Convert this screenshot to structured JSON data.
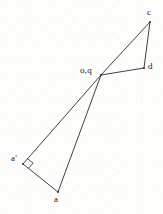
{
  "figure": {
    "kind": "line-diagram",
    "width": 163,
    "height": 214,
    "background_color": "#fdfdfc",
    "stroke_color": "#2b2b2b",
    "stroke_width": 0.9,
    "label_color": "#1a1a1a"
  },
  "points": {
    "o_q": {
      "name": "o,q",
      "x": 101,
      "y": 75
    },
    "c": {
      "name": "c",
      "x": 150,
      "y": 22
    },
    "d": {
      "name": "d",
      "x": 144,
      "y": 68
    },
    "a_prime": {
      "name": "a'",
      "x": 23,
      "y": 164
    },
    "a": {
      "name": "a",
      "x": 58,
      "y": 192
    }
  },
  "edges": [
    {
      "name": "oq-to-c",
      "from": "o_q",
      "to": "c"
    },
    {
      "name": "c-to-d",
      "from": "c",
      "to": "d"
    },
    {
      "name": "d-to-oq",
      "from": "d",
      "to": "o_q"
    },
    {
      "name": "oq-to-a-prime",
      "from": "o_q",
      "to": "a_prime"
    },
    {
      "name": "a-prime-to-a",
      "from": "a_prime",
      "to": "a"
    },
    {
      "name": "a-to-oq",
      "from": "a",
      "to": "o_q"
    }
  ],
  "markers": [
    {
      "name": "right-angle-marker",
      "at_point": "a_prime",
      "kind": "right-angle-square",
      "size": 7
    }
  ],
  "labels": [
    {
      "name": "label-c",
      "text": "c",
      "x": 147,
      "y": 8
    },
    {
      "name": "label-d",
      "text": "d",
      "x": 148,
      "y": 62
    },
    {
      "name": "label-o-q",
      "text": "o,q",
      "x": 80,
      "y": 66
    },
    {
      "name": "label-a-prime",
      "text": "a'",
      "x": 11,
      "y": 154
    },
    {
      "name": "label-a",
      "text": "a",
      "x": 54,
      "y": 195
    }
  ]
}
